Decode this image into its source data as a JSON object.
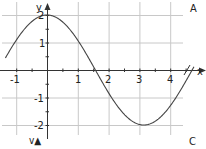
{
  "chart_data": {
    "type": "line",
    "title": "",
    "function": "y = 2 cos(x)",
    "xlabel": "x",
    "ylabel": "y",
    "xlim": [
      -1.3,
      4.9
    ],
    "ylim": [
      -2.3,
      2.5
    ],
    "x_ticks": [
      -1,
      1,
      2,
      3,
      4
    ],
    "y_ticks": [
      2,
      1,
      -1,
      -2
    ],
    "x_tick_labels": [
      "-1",
      "1",
      "2",
      "3",
      "4"
    ],
    "y_tick_labels": [
      "2",
      "1",
      "-1",
      "-2"
    ],
    "grid": true,
    "series": [
      {
        "name": "y = 2cos(x)",
        "x": [
          -1.2,
          -1.0,
          -0.5,
          0,
          0.5,
          1.0,
          1.5708,
          2.0,
          2.5,
          3.1416,
          3.5,
          4.0,
          4.5,
          4.75
        ],
        "values": [
          0.72,
          1.08,
          1.76,
          2.0,
          1.76,
          1.08,
          0.0,
          -0.83,
          -1.6,
          -2.0,
          -1.87,
          -1.31,
          -0.42,
          0.08
        ]
      }
    ],
    "annotations": [
      "A",
      "C",
      "v▲"
    ]
  },
  "labels": {
    "y_axis": "y",
    "x_axis": "x",
    "corner_top_right": "A",
    "corner_bottom_right": "C",
    "bottom_left": "v▲",
    "tick_x_m1": "-1",
    "tick_x_1": "1",
    "tick_x_2": "2",
    "tick_x_3": "3",
    "tick_x_4": "4",
    "tick_y_2": "2",
    "tick_y_1": "1",
    "tick_y_m1": "-1",
    "tick_y_m2": "-2"
  },
  "colors": {
    "grid": "#c8c8c8",
    "axis": "#333333",
    "curve": "#444444",
    "text": "#222222"
  }
}
